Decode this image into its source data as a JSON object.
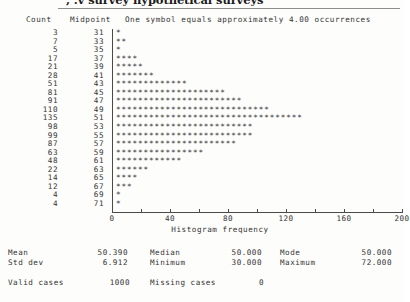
{
  "document": {
    "title_fragment": ", .v  survey hypothetical surveys",
    "page_background": "#fdfdfc",
    "ink_color": "#2e2e2e"
  },
  "headers": {
    "count": "Count",
    "midpoint": "Midpoint",
    "legend": "One symbol equals approximately   4.00 occurrences"
  },
  "chart_data": {
    "type": "bar",
    "orientation": "horizontal",
    "title": "",
    "xlabel": "Histogram frequency",
    "ylabel": "Midpoint",
    "xlim": [
      0,
      200
    ],
    "xticks": [
      0,
      20,
      40,
      60,
      80,
      100,
      120,
      140,
      160,
      180,
      200
    ],
    "xtick_labels": [
      "0",
      "",
      "40",
      "",
      "80",
      "",
      "120",
      "",
      "160",
      "",
      "200"
    ],
    "grid": false,
    "legend": "One symbol equals approximately 4.00 occurrences",
    "symbol": "*",
    "symbol_value": 4.0,
    "categories": [
      31,
      33,
      35,
      37,
      39,
      41,
      43,
      45,
      47,
      49,
      51,
      53,
      55,
      57,
      59,
      61,
      63,
      65,
      67,
      69,
      71
    ],
    "values": [
      3,
      7,
      5,
      17,
      21,
      28,
      51,
      81,
      91,
      110,
      135,
      98,
      99,
      87,
      63,
      48,
      22,
      14,
      12,
      4,
      4
    ],
    "symbol_counts": [
      1,
      2,
      1,
      4,
      5,
      7,
      13,
      20,
      23,
      28,
      34,
      25,
      25,
      22,
      16,
      12,
      6,
      4,
      3,
      1,
      1
    ]
  },
  "axis": {
    "x_title": "Histogram frequency",
    "tick_labels": [
      {
        "value": 0,
        "label": "0"
      },
      {
        "value": 40,
        "label": "40"
      },
      {
        "value": 80,
        "label": "80"
      },
      {
        "value": 120,
        "label": "120"
      },
      {
        "value": 160,
        "label": "160"
      },
      {
        "value": 200,
        "label": "200"
      }
    ]
  },
  "statistics": {
    "rows": [
      {
        "label1": "Mean",
        "value1": "50.390",
        "label2": "Median",
        "value2": "50.000",
        "label3": "Mode",
        "value3": "50.000"
      },
      {
        "label1": "Std dev",
        "value1": "6.912",
        "label2": "Minimum",
        "value2": "30.000",
        "label3": "Maximum",
        "value3": "72.000"
      }
    ],
    "valid_cases_label": "Valid cases",
    "valid_cases_value": "1000",
    "missing_cases_label": "Missing cases",
    "missing_cases_value": "0"
  }
}
